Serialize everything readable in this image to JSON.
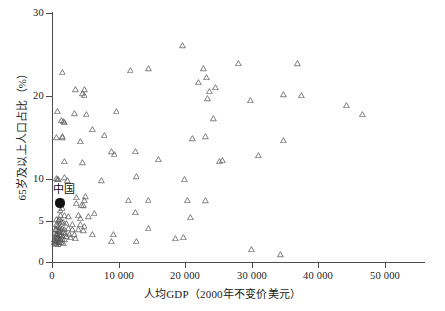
{
  "chart_data": {
    "type": "scatter",
    "title": "",
    "xlabel": "人均GDP（2000年不变价美元）",
    "ylabel": "65岁及以上人口占比（%）",
    "xlim": [
      0,
      53000
    ],
    "ylim": [
      0,
      30
    ],
    "xticks": [
      0,
      10000,
      20000,
      30000,
      40000,
      50000
    ],
    "xticklabels": [
      "0",
      "10 000",
      "20 000",
      "30 000",
      "40 000",
      "50 000"
    ],
    "yticks": [
      0,
      5,
      10,
      20,
      30
    ],
    "yticklabels": [
      "0",
      "5",
      "10",
      "20",
      "30"
    ],
    "grid": false,
    "legend": false,
    "marker": "open-triangle",
    "marker_color": "#555555",
    "annotations": [
      {
        "label": "中国",
        "x": 1200,
        "y": 7.1,
        "marker": "filled-circle",
        "marker_color": "#111111"
      }
    ],
    "series": [
      {
        "name": "国家/地区",
        "points": [
          [
            1500,
            22.9
          ],
          [
            3500,
            20.8
          ],
          [
            4900,
            20.8
          ],
          [
            4500,
            20.3
          ],
          [
            4800,
            20.1
          ],
          [
            11700,
            23.1
          ],
          [
            14500,
            23.3
          ],
          [
            19600,
            26.1
          ],
          [
            22800,
            23.3
          ],
          [
            22000,
            21.7
          ],
          [
            23200,
            22.3
          ],
          [
            24600,
            21.1
          ],
          [
            23600,
            20.6
          ],
          [
            28000,
            24.0
          ],
          [
            36800,
            23.9
          ],
          [
            34800,
            20.2
          ],
          [
            37400,
            20.1
          ],
          [
            44200,
            18.9
          ],
          [
            46600,
            17.8
          ],
          [
            29800,
            19.5
          ],
          [
            23400,
            19.7
          ],
          [
            24300,
            17.3
          ],
          [
            9600,
            18.2
          ],
          [
            3400,
            17.9
          ],
          [
            5100,
            17.8
          ],
          [
            800,
            18.2
          ],
          [
            1400,
            17.1
          ],
          [
            1700,
            17.0
          ],
          [
            1900,
            16.9
          ],
          [
            6100,
            16.0
          ],
          [
            7800,
            15.3
          ],
          [
            680,
            15.0
          ],
          [
            1500,
            15.1
          ],
          [
            1600,
            15.0
          ],
          [
            4300,
            14.6
          ],
          [
            21100,
            14.9
          ],
          [
            23100,
            15.1
          ],
          [
            34700,
            14.7
          ],
          [
            1900,
            12.2
          ],
          [
            4600,
            12.0
          ],
          [
            8900,
            13.3
          ],
          [
            9300,
            13.0
          ],
          [
            12500,
            13.4
          ],
          [
            16000,
            12.4
          ],
          [
            25200,
            12.2
          ],
          [
            25600,
            12.3
          ],
          [
            31000,
            12.9
          ],
          [
            660,
            10.1
          ],
          [
            800,
            10.0
          ],
          [
            1000,
            10.0
          ],
          [
            1800,
            10.2
          ],
          [
            2300,
            9.8
          ],
          [
            7400,
            9.8
          ],
          [
            12600,
            10.3
          ],
          [
            19900,
            10.0
          ],
          [
            20400,
            7.5
          ],
          [
            23000,
            7.4
          ],
          [
            11500,
            7.5
          ],
          [
            14400,
            7.5
          ],
          [
            3700,
            7.8
          ],
          [
            5000,
            7.9
          ],
          [
            4900,
            7.5
          ],
          [
            3600,
            7.1
          ],
          [
            4400,
            6.9
          ],
          [
            4700,
            6.8
          ],
          [
            1500,
            6.5
          ],
          [
            1200,
            6.2
          ],
          [
            12500,
            6.0
          ],
          [
            6300,
            5.9
          ],
          [
            20800,
            5.4
          ],
          [
            5500,
            5.5
          ],
          [
            1200,
            5.7
          ],
          [
            1800,
            5.6
          ],
          [
            2500,
            5.5
          ],
          [
            3900,
            5.7
          ],
          [
            4300,
            5.3
          ],
          [
            700,
            5.2
          ],
          [
            900,
            5.0
          ],
          [
            1100,
            5.1
          ],
          [
            1400,
            4.9
          ],
          [
            1700,
            4.8
          ],
          [
            2100,
            4.7
          ],
          [
            3100,
            4.6
          ],
          [
            4200,
            4.5
          ],
          [
            4800,
            4.3
          ],
          [
            600,
            4.6
          ],
          [
            800,
            4.4
          ],
          [
            1000,
            4.3
          ],
          [
            1300,
            4.2
          ],
          [
            1500,
            4.1
          ],
          [
            1900,
            4.0
          ],
          [
            2400,
            4.1
          ],
          [
            3000,
            3.9
          ],
          [
            3900,
            3.9
          ],
          [
            4700,
            3.8
          ],
          [
            520,
            4.0
          ],
          [
            700,
            3.9
          ],
          [
            900,
            3.8
          ],
          [
            1100,
            3.7
          ],
          [
            1400,
            3.6
          ],
          [
            1700,
            3.6
          ],
          [
            2000,
            3.5
          ],
          [
            2600,
            3.4
          ],
          [
            3300,
            3.3
          ],
          [
            6100,
            3.4
          ],
          [
            480,
            3.5
          ],
          [
            640,
            3.4
          ],
          [
            820,
            3.3
          ],
          [
            1050,
            3.3
          ],
          [
            1300,
            3.2
          ],
          [
            1600,
            3.1
          ],
          [
            2200,
            3.1
          ],
          [
            2800,
            3.0
          ],
          [
            3500,
            2.9
          ],
          [
            9200,
            3.4
          ],
          [
            440,
            3.1
          ],
          [
            600,
            3.0
          ],
          [
            760,
            2.9
          ],
          [
            960,
            2.9
          ],
          [
            1200,
            2.8
          ],
          [
            1500,
            2.7
          ],
          [
            1900,
            2.7
          ],
          [
            400,
            2.7
          ],
          [
            560,
            2.6
          ],
          [
            720,
            2.5
          ],
          [
            900,
            2.5
          ],
          [
            1150,
            2.4
          ],
          [
            1450,
            2.4
          ],
          [
            380,
            2.4
          ],
          [
            520,
            2.3
          ],
          [
            700,
            2.2
          ],
          [
            900,
            2.2
          ],
          [
            1700,
            2.3
          ],
          [
            8900,
            2.5
          ],
          [
            12600,
            2.5
          ],
          [
            18500,
            2.9
          ],
          [
            19800,
            3.0
          ],
          [
            14400,
            4.1
          ],
          [
            29900,
            1.6
          ],
          [
            34300,
            0.9
          ]
        ]
      }
    ]
  }
}
